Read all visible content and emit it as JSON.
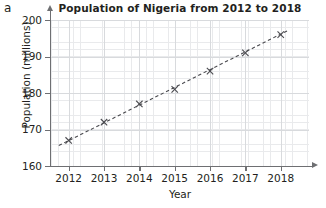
{
  "part_label": "a",
  "chart_data": {
    "type": "scatter",
    "title": "Population of Nigeria from 2012 to 2018",
    "xlabel": "Year",
    "ylabel": "Population (millions)",
    "x": [
      2012,
      2013,
      2014,
      2015,
      2016,
      2017,
      2018
    ],
    "values": [
      167,
      172,
      177,
      181,
      186,
      191,
      196
    ],
    "categories": [
      "2012",
      "2013",
      "2014",
      "2015",
      "2016",
      "2017",
      "2018"
    ],
    "xtick_labels": [
      "2012",
      "2013",
      "2014",
      "2015",
      "2016",
      "2017",
      "2018"
    ],
    "ytick_labels": [
      "160",
      "170",
      "180",
      "190",
      "200"
    ],
    "ytick_values": [
      160,
      170,
      180,
      190,
      200
    ],
    "xlim": [
      2011.5,
      2018.8
    ],
    "ylim": [
      160,
      200
    ],
    "grid": true,
    "legend": "none",
    "marker": "x",
    "marker_color": "#4a4a4f",
    "trendline": {
      "style": "dashed",
      "color": "#4a4a4f",
      "x_start": 2011.72,
      "y_start": 165.6,
      "x_end": 2018.22,
      "y_end": 197.2
    },
    "grid_color": "#e9eaec",
    "axis_color": "#6e6f72"
  }
}
